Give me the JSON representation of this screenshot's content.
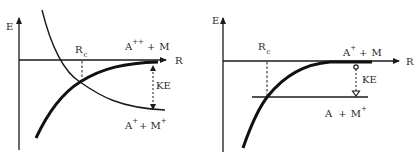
{
  "colors": {
    "ink": "#1a1a1a",
    "text": "#2a2a2a",
    "background": "#ffffff"
  },
  "left": {
    "y_axis_label": "E",
    "x_axis_label": "R",
    "crossing": {
      "base": "R",
      "subscript": "c"
    },
    "upper_asymptote": {
      "a": "A",
      "a_charge": "++",
      "plus": "+",
      "m": "M",
      "m_charge": ""
    },
    "lower_asymptote": {
      "a": "A",
      "a_charge": "+",
      "plus": "+",
      "m": "M",
      "m_charge": "+"
    },
    "gap_label": "KE"
  },
  "right": {
    "y_axis_label": "E",
    "x_axis_label": "R",
    "crossing": {
      "base": "R",
      "subscript": "c"
    },
    "upper_asymptote": {
      "a": "A",
      "a_charge": "+",
      "plus": "+",
      "m": "M",
      "m_charge": ""
    },
    "lower_asymptote": {
      "a": "A",
      "a_charge": "",
      "plus": "+",
      "m": "M",
      "m_charge": "+"
    },
    "gap_label": "KE"
  }
}
